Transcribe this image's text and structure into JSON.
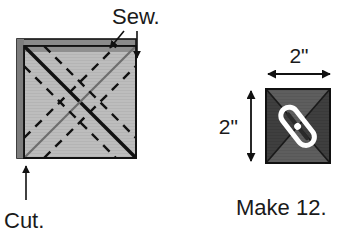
{
  "figure": {
    "type": "instructional-diagram"
  },
  "left_figure": {
    "name": "marked-fabric-square",
    "labels": {
      "sew": "Sew.",
      "cut": "Cut."
    },
    "description": "Layered fabric square with two solid diagonal lines and dashed sewing lines parallel to each diagonal",
    "colors": {
      "fabric_fill": "#bdbdbd",
      "fabric_edge": "#7a7a7a",
      "outline": "#111111",
      "solid_diagonal_dark": "#111111",
      "solid_diagonal_light": "#6e6e6e",
      "dashed_line": "#111111"
    },
    "annotations": [
      {
        "label": "Sew.",
        "arrows": 2,
        "points_to": "top-edge-and-right-edge"
      },
      {
        "label": "Cut.",
        "arrows": 1,
        "points_to": "bottom-left-corner"
      }
    ]
  },
  "right_figure": {
    "name": "finished-hourglass-block",
    "caption": "Make 12.",
    "dimensions": {
      "width_label": "2\"",
      "height_label": "2\""
    },
    "description": "Finished dark square divided by an X into four triangles with a white thread/stitch motif across the center",
    "colors": {
      "triangle_top": "#5e5e5e",
      "triangle_bottom": "#5e5e5e",
      "triangle_left": "#3f3f3f",
      "triangle_right": "#3f3f3f",
      "outline": "#111111",
      "stitch_outline": "#ffffff",
      "stitch_core": "#2a2a2a"
    }
  }
}
